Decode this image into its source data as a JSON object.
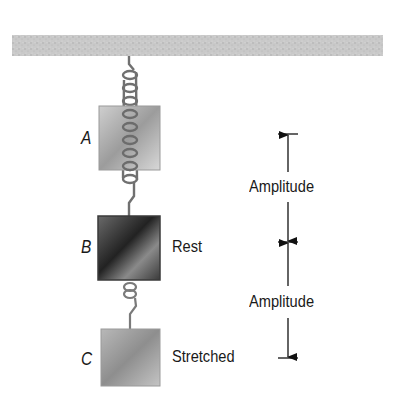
{
  "diagram": {
    "type": "spring-mass oscillation",
    "ceiling": {
      "label": ""
    },
    "positions": [
      {
        "letter": "A",
        "state": ""
      },
      {
        "letter": "B",
        "state": "Rest"
      },
      {
        "letter": "C",
        "state": "Stretched"
      }
    ],
    "dimensions": [
      {
        "label": "Amplitude"
      },
      {
        "label": "Amplitude"
      }
    ]
  }
}
